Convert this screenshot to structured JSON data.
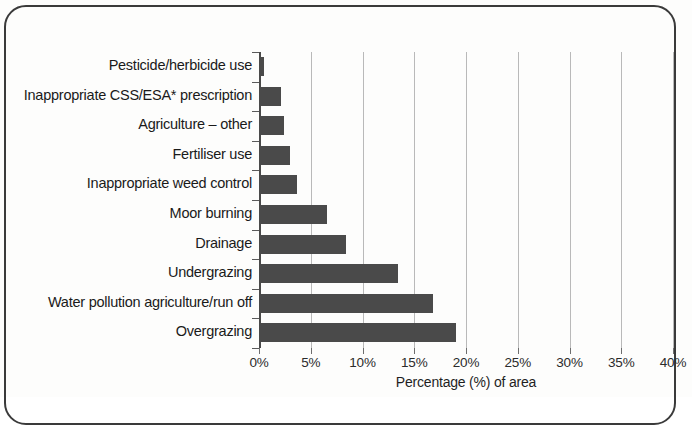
{
  "chart_data": {
    "type": "bar",
    "orientation": "horizontal",
    "title": "",
    "xlabel": "Percentage (%) of area",
    "ylabel": "",
    "xlim": [
      0,
      40
    ],
    "xticks": [
      0,
      5,
      10,
      15,
      20,
      25,
      30,
      35,
      40
    ],
    "xticklabels": [
      "0%",
      "5%",
      "10%",
      "15%",
      "20%",
      "25%",
      "30%",
      "35%",
      "40%"
    ],
    "grid": "vertical",
    "legend": "none",
    "bar_color": "#4a4a4a",
    "categories": [
      "Pesticide/herbicide use",
      "Inappropriate CSS/ESA* prescription",
      "Agriculture – other",
      "Fertiliser use",
      "Inappropriate weed control",
      "Moor burning",
      "Drainage",
      "Undergrazing",
      "Water pollution agriculture/run off",
      "Overgrazing"
    ],
    "values": [
      0.5,
      2.1,
      2.4,
      3.0,
      3.7,
      6.6,
      8.4,
      13.4,
      16.8,
      19.0
    ]
  }
}
